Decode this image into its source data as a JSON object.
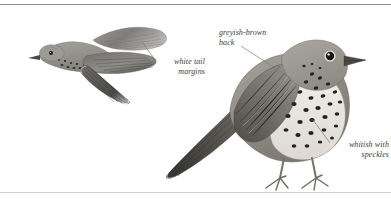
{
  "plate": {
    "background_color": "#ffffff",
    "ink_color": "#3a3a3c",
    "rule_color_top": "#8e8e90",
    "rule_color_bottom": "#cfcfd2",
    "width": 391,
    "height": 198
  },
  "figures": [
    {
      "name": "flight-bird",
      "pose": "in flight, head to left, wings swept back, tail fanned",
      "plumage_color": "#8d8c88"
    },
    {
      "name": "perched-bird",
      "pose": "standing in profile facing right, long tail to the left",
      "plumage_color": "#93918c"
    }
  ],
  "annotations": [
    {
      "id": "white-tail-margins",
      "text": "white tail\nmargins",
      "align": "right",
      "x": 157,
      "y": 57,
      "width": 48,
      "leader": {
        "x1": 142,
        "y1": 42,
        "x2": 156,
        "y2": 61
      }
    },
    {
      "id": "greyish-brown-back",
      "text": "greyish-brown\nback",
      "align": "left",
      "x": 219,
      "y": 28,
      "width": 70,
      "leader": {
        "x1": 241,
        "y1": 46,
        "x2": 292,
        "y2": 79
      }
    },
    {
      "id": "whitish-with-speckles",
      "text": "whitish with\nspeckles",
      "align": "right",
      "x": 331,
      "y": 140,
      "width": 58,
      "leader": {
        "x1": 313,
        "y1": 120,
        "x2": 330,
        "y2": 143
      }
    }
  ]
}
